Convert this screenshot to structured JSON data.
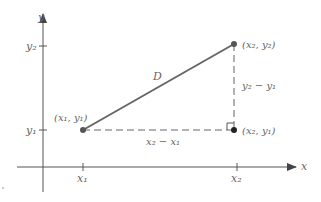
{
  "diagram": {
    "axes": {
      "x_label": "x",
      "y_label": "y",
      "x_ticks": [
        {
          "label": "x₁",
          "value": "x1"
        },
        {
          "label": "x₂",
          "value": "x2"
        }
      ],
      "y_ticks": [
        {
          "label": "y₁",
          "value": "y1"
        },
        {
          "label": "y₂",
          "value": "y2"
        }
      ]
    },
    "points": [
      {
        "id": "p1",
        "label": "(x₁, y₁)"
      },
      {
        "id": "p2",
        "label": "(x₂, y₂)"
      },
      {
        "id": "p3",
        "label": "(x₂, y₁)"
      }
    ],
    "segments": {
      "hypotenuse_label": "D",
      "horizontal_label": "x₂ − x₁",
      "vertical_label": "y₂ − y₁"
    },
    "colors": {
      "line": "#666666",
      "point": "#555555",
      "axis": "#555555",
      "text": "#666666"
    }
  }
}
